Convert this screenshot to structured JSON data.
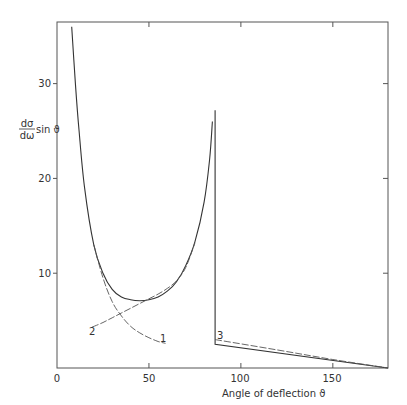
{
  "chart_data": {
    "type": "line",
    "title": "",
    "xlabel": "Angle of deflection ϑ",
    "ylabel": {
      "numerator": "dσ",
      "denominator": "dω",
      "suffix": "sin ϑ"
    },
    "xlim": [
      0,
      180
    ],
    "ylim": [
      0,
      36
    ],
    "x_ticks": [
      0,
      50,
      100,
      150
    ],
    "x_tick_labels": [
      "0",
      "50",
      "100",
      "150"
    ],
    "y_ticks": [
      10,
      20,
      30
    ],
    "y_tick_labels": [
      "10",
      "20",
      "30"
    ],
    "grid": false,
    "legend": "none (curves labelled inline)",
    "series": [
      {
        "name": "total",
        "style": "solid",
        "points": [
          [
            8,
            36
          ],
          [
            10,
            30
          ],
          [
            12,
            25
          ],
          [
            15,
            19
          ],
          [
            20,
            13
          ],
          [
            25,
            10
          ],
          [
            30,
            8.3
          ],
          [
            35,
            7.5
          ],
          [
            40,
            7.2
          ],
          [
            45,
            7.1
          ],
          [
            50,
            7.2
          ],
          [
            55,
            7.5
          ],
          [
            60,
            8.1
          ],
          [
            65,
            9.1
          ],
          [
            70,
            10.8
          ],
          [
            75,
            13.3
          ],
          [
            80,
            17.5
          ],
          [
            83,
            22
          ],
          [
            84.5,
            26
          ]
        ]
      },
      {
        "name": "total-backward",
        "style": "solid",
        "points": [
          [
            86,
            27.2
          ],
          [
            86,
            2.5
          ],
          [
            180,
            0
          ]
        ]
      },
      {
        "name": "1",
        "label": "1",
        "style": "dashed",
        "points": [
          [
            20,
            13
          ],
          [
            25,
            9.5
          ],
          [
            30,
            7
          ],
          [
            35,
            5.5
          ],
          [
            40,
            4.4
          ],
          [
            45,
            3.7
          ],
          [
            50,
            3.2
          ],
          [
            55,
            2.8
          ],
          [
            59,
            2.6
          ]
        ]
      },
      {
        "name": "2",
        "label": "2",
        "style": "dashed",
        "points": [
          [
            19,
            4.3
          ],
          [
            25,
            4.8
          ],
          [
            30,
            5.3
          ],
          [
            35,
            5.8
          ],
          [
            40,
            6.3
          ],
          [
            45,
            6.8
          ],
          [
            50,
            7.3
          ],
          [
            55,
            7.8
          ],
          [
            60,
            8.4
          ],
          [
            65,
            9.2
          ],
          [
            70,
            10.6
          ],
          [
            75,
            13.2
          ]
        ]
      },
      {
        "name": "3",
        "label": "3",
        "style": "dashed",
        "points": [
          [
            86,
            3.0
          ],
          [
            120,
            1.9
          ],
          [
            150,
            0.9
          ],
          [
            180,
            0
          ]
        ]
      }
    ]
  }
}
